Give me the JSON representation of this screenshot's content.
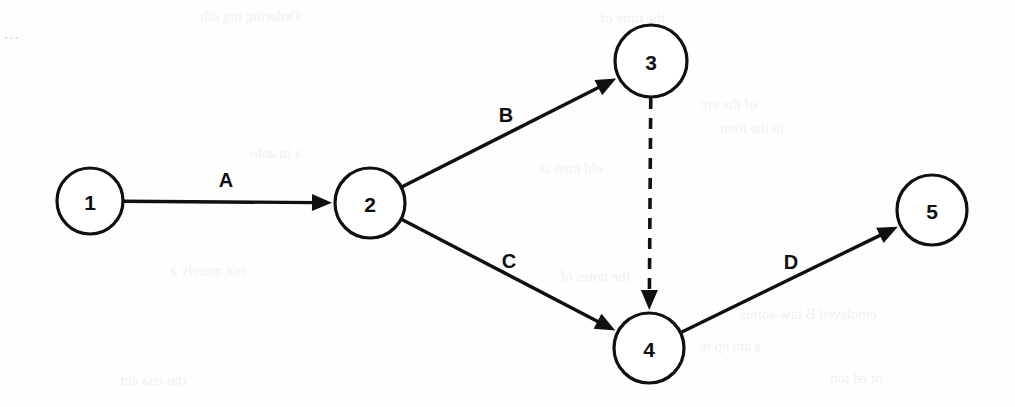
{
  "page": {
    "width": 1015,
    "height": 407,
    "background_color": "#fefefe",
    "ink_color": "#101010",
    "corner_mark": "..."
  },
  "diagram": {
    "type": "directed-graph",
    "node_radius": 35,
    "nodes": [
      {
        "id": "1",
        "label": "1",
        "cx": 90,
        "cy": 201,
        "r": 33
      },
      {
        "id": "2",
        "label": "2",
        "cx": 370,
        "cy": 203,
        "r": 35
      },
      {
        "id": "3",
        "label": "3",
        "cx": 651,
        "cy": 61,
        "r": 36
      },
      {
        "id": "4",
        "label": "4",
        "cx": 649,
        "cy": 348,
        "r": 35
      },
      {
        "id": "5",
        "label": "5",
        "cx": 932,
        "cy": 210,
        "r": 35
      }
    ],
    "edges": [
      {
        "id": "A",
        "label": "A",
        "from": "1",
        "to": "2",
        "style": "solid",
        "label_x": 226,
        "label_y": 180
      },
      {
        "id": "B",
        "label": "B",
        "from": "2",
        "to": "3",
        "style": "solid",
        "label_x": 506,
        "label_y": 115
      },
      {
        "id": "C",
        "label": "C",
        "from": "2",
        "to": "4",
        "style": "solid",
        "label_x": 509,
        "label_y": 261
      },
      {
        "id": "dummy",
        "label": "",
        "from": "3",
        "to": "4",
        "style": "dashed",
        "label_x": 0,
        "label_y": 0
      },
      {
        "id": "D",
        "label": "D",
        "from": "4",
        "to": "5",
        "style": "solid",
        "label_x": 791,
        "label_y": 262
      }
    ]
  },
  "background_bleed": {
    "note": "faint show-through text from reverse of scanned page",
    "lines": [
      {
        "text": "Ordering  mg oib",
        "x": 200,
        "y": 8
      },
      {
        "text": "the time of",
        "x": 600,
        "y": 10
      },
      {
        "text": "of the ere",
        "x": 700,
        "y": 96
      },
      {
        "text": "in the item",
        "x": 720,
        "y": 120
      },
      {
        "text": "a in anlo",
        "x": 250,
        "y": 145
      },
      {
        "text": "eld men at",
        "x": 540,
        "y": 160
      },
      {
        "text": "not merely a",
        "x": 170,
        "y": 262
      },
      {
        "text": "the notes of",
        "x": 560,
        "y": 268
      },
      {
        "text": "emolsved  B  taw-soitos",
        "x": 740,
        "y": 306
      },
      {
        "text": "a  ato  ep  te",
        "x": 700,
        "y": 338
      },
      {
        "text": "rho ena  aht",
        "x": 120,
        "y": 372
      },
      {
        "text": "ot ed  ton",
        "x": 830,
        "y": 370
      }
    ]
  }
}
